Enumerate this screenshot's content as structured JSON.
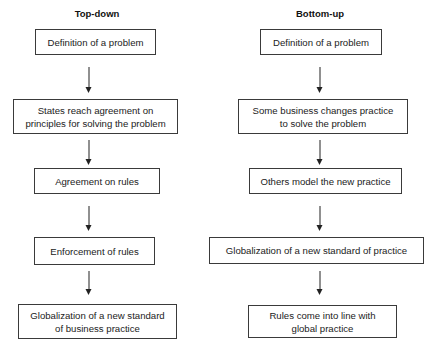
{
  "diagram": {
    "columns": [
      {
        "title": "Top-down",
        "steps": [
          {
            "label": "Definition of a problem"
          },
          {
            "label": "States reach agreement on principles for solving the problem",
            "lines": [
              "States reach agreement on",
              "principles for solving the problem"
            ]
          },
          {
            "label": "Agreement on rules"
          },
          {
            "label": "Enforcement of rules"
          },
          {
            "label": "Globalization of a new standard of business practice",
            "lines": [
              "Globalization of a new standard",
              "of business practice"
            ]
          }
        ]
      },
      {
        "title": "Bottom-up",
        "steps": [
          {
            "label": "Definition of a problem"
          },
          {
            "label": "Some business changes practice to solve the problem",
            "lines": [
              "Some business changes practice",
              "to solve the problem"
            ]
          },
          {
            "label": "Others model the new practice"
          },
          {
            "label": "Globalization of a new standard of practice"
          },
          {
            "label": "Rules come into line with global practice",
            "lines": [
              "Rules come into line with",
              "global practice"
            ]
          }
        ]
      }
    ],
    "connector": "arrow-down"
  }
}
